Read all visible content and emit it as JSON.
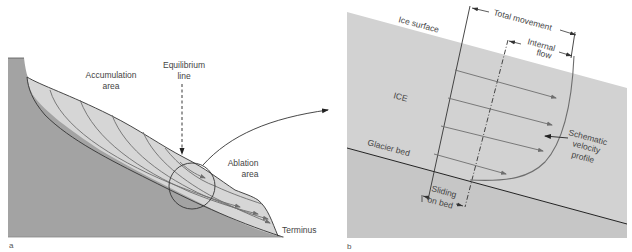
{
  "panel_a": {
    "label": "a",
    "accumulation_line1": "Accumulation",
    "accumulation_line2": "area",
    "equilibrium_line1": "Equilibrium",
    "equilibrium_line2": "line",
    "ablation_line1": "Ablation",
    "ablation_line2": "area",
    "terminus": "Terminus"
  },
  "panel_b": {
    "label": "b",
    "ice_surface": "Ice surface",
    "total_movement": "Total movement",
    "internal_line1": "Internal",
    "internal_line2": "flow",
    "ice": "ICE",
    "glacier_bed": "Glacier bed",
    "schematic_line1": "Schematic",
    "schematic_line2": "velocity",
    "schematic_line3": "profile",
    "sliding_line1": "Sliding",
    "sliding_line2": "on bed"
  },
  "colors": {
    "bedrock": "#a3a3a3",
    "glacier_ice": "#d6d6d6",
    "panel_b_ice": "#d2d2d2",
    "panel_b_bed": "#c6c6c6",
    "line": "#333333",
    "flow_line": "#6e6e6e"
  }
}
